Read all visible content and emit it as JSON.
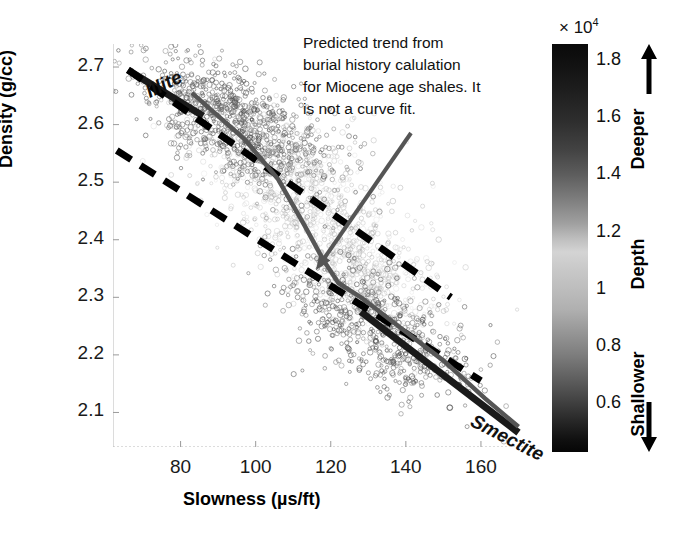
{
  "chart_data": {
    "type": "scatter",
    "title": "",
    "xlabel": "Slowness (µs/ft)",
    "ylabel": "Density (g/cc)",
    "xlim": [
      62,
      172
    ],
    "ylim": [
      2.04,
      2.74
    ],
    "xticks": [
      80,
      100,
      120,
      140,
      160
    ],
    "yticks": [
      2.1,
      2.2,
      2.3,
      2.4,
      2.5,
      2.6,
      2.7
    ],
    "grid": false,
    "legend_position": "none",
    "colorbar": {
      "label": "Depth",
      "exponent_label": "× 10",
      "exponent_value": "4",
      "ticks": [
        "1.8",
        "1.6",
        "1.4",
        "1.2",
        "1",
        "0.8",
        "0.6"
      ],
      "top_arrow_label": "Deeper",
      "bottom_arrow_label": "Shallower",
      "range": [
        5000,
        19500
      ],
      "colormap": "grayscale-depth"
    },
    "annotations": [
      {
        "name": "predicted-trend-note",
        "lines": [
          "Predicted trend from",
          "burial history calulation",
          "for Miocene age shales. It",
          "is not a curve fit."
        ],
        "arrow_from": [
          411,
          133
        ],
        "arrow_to": [
          316,
          270
        ],
        "color": "#555555"
      },
      {
        "name": "illite-label",
        "text": "Illite",
        "x": 85,
        "y": 2.68
      },
      {
        "name": "smectite-label",
        "text": "Smectite",
        "x": 162,
        "y": 2.11
      }
    ],
    "series": [
      {
        "name": "shale-data-points",
        "type": "scatter",
        "marker": "open-circle",
        "color_by": "depth",
        "n_points": 2600,
        "clusters": [
          {
            "cx": 95,
            "cy": 2.6,
            "sx": 13,
            "sy": 0.045,
            "n": 900,
            "shade": "dark"
          },
          {
            "cx": 112,
            "cy": 2.48,
            "sx": 14,
            "sy": 0.06,
            "n": 600,
            "shade": "light"
          },
          {
            "cx": 128,
            "cy": 2.34,
            "sx": 11,
            "sy": 0.05,
            "n": 500,
            "shade": "light"
          },
          {
            "cx": 133,
            "cy": 2.24,
            "sx": 12,
            "sy": 0.05,
            "n": 600,
            "shade": "dark"
          }
        ]
      },
      {
        "name": "illite-trend-line",
        "type": "line",
        "style": "dashed",
        "color": "#000000",
        "points": [
          [
            66,
            2.695
          ],
          [
            152,
            2.3
          ]
        ]
      },
      {
        "name": "smectite-trend-line",
        "type": "line",
        "style": "dashed",
        "color": "#000000",
        "points": [
          [
            63,
            2.555
          ],
          [
            160,
            2.155
          ]
        ]
      },
      {
        "name": "illite-solid-line",
        "type": "line",
        "style": "solid",
        "color": "#1a1a1a",
        "points": [
          [
            66,
            2.695
          ],
          [
            86,
            2.615
          ]
        ]
      },
      {
        "name": "smectite-solid-line",
        "type": "line",
        "style": "solid",
        "color": "#1a1a1a",
        "points": [
          [
            128,
            2.275
          ],
          [
            170,
            2.065
          ]
        ]
      },
      {
        "name": "predicted-burial-trend",
        "type": "line",
        "style": "solid",
        "color": "#555555",
        "points": [
          [
            83,
            2.655
          ],
          [
            97,
            2.575
          ],
          [
            106,
            2.505
          ],
          [
            113,
            2.425
          ],
          [
            118,
            2.365
          ],
          [
            122,
            2.325
          ],
          [
            128,
            2.3
          ],
          [
            139,
            2.245
          ],
          [
            150,
            2.19
          ],
          [
            161,
            2.125
          ],
          [
            170,
            2.075
          ]
        ]
      }
    ]
  }
}
